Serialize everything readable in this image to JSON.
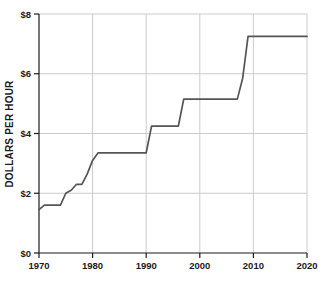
{
  "chart_data": {
    "type": "line",
    "title": "",
    "subtitle": "",
    "xlabel": "",
    "ylabel": "DOLLARS PER HOUR",
    "xlim": [
      1970,
      2020
    ],
    "ylim": [
      0,
      8
    ],
    "grid": true,
    "legend": null,
    "line_color": "#555555",
    "axis_color": "#1b1b1b",
    "grid_color": "#cccccc",
    "background_color": "#ffffff",
    "xticks": [
      1970,
      1980,
      1990,
      2000,
      2010,
      2020
    ],
    "xtick_labels": [
      "1970",
      "1980",
      "1990",
      "2000",
      "2010",
      "2020"
    ],
    "yticks": [
      0,
      2,
      4,
      6,
      8
    ],
    "ytick_labels": [
      "$0",
      "$2",
      "$4",
      "$6",
      "$8"
    ],
    "series": [
      {
        "name": "Minimum wage",
        "x": [
          1970,
          1971,
          1974,
          1975,
          1976,
          1977,
          1978,
          1979,
          1980,
          1981,
          1990,
          1991,
          1996,
          1997,
          2007,
          2008,
          2009,
          2020
        ],
        "values": [
          1.45,
          1.6,
          1.6,
          2.0,
          2.1,
          2.3,
          2.3,
          2.65,
          3.1,
          3.35,
          3.35,
          4.25,
          4.25,
          5.15,
          5.15,
          5.85,
          7.25,
          7.25
        ]
      }
    ]
  }
}
